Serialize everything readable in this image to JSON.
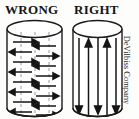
{
  "figure": {
    "title_left": "WRONG",
    "title_right": "RIGHT",
    "credit": "DeVilbiss Company",
    "colors": {
      "ink": "#151515",
      "outline": "#1a1a1a",
      "dashed_guide": "#9a9a9a",
      "background": "#fdfdfc"
    }
  },
  "panels": {
    "wrong": {
      "name": "WRONG",
      "cylinder": {
        "left": 2,
        "right": 57,
        "top_ellipse_cy": 11,
        "bottom_ellipse_cy": 90,
        "rx": 27.5,
        "ry": 8.5
      },
      "guides": [
        {
          "x": 16,
          "dashed": true
        },
        {
          "x": 30,
          "dashed": true
        },
        {
          "x": 44,
          "dashed": true
        }
      ],
      "arrows": [
        {
          "row": 1,
          "y": 24,
          "x1": 8,
          "x2": 29,
          "direction": "right"
        },
        {
          "row": 1,
          "y": 27,
          "x1": 51,
          "x2": 32,
          "direction": "left"
        },
        {
          "row": 2,
          "y": 33,
          "x1": 27,
          "x2": 6,
          "direction": "left"
        },
        {
          "row": 2,
          "y": 36,
          "x1": 31,
          "x2": 52,
          "direction": "right"
        },
        {
          "row": 3,
          "y": 42,
          "x1": 8,
          "x2": 29,
          "direction": "right"
        },
        {
          "row": 3,
          "y": 45,
          "x1": 51,
          "x2": 32,
          "direction": "left"
        },
        {
          "row": 4,
          "y": 51,
          "x1": 27,
          "x2": 6,
          "direction": "left"
        },
        {
          "row": 4,
          "y": 54,
          "x1": 31,
          "x2": 52,
          "direction": "right"
        },
        {
          "row": 5,
          "y": 60,
          "x1": 8,
          "x2": 29,
          "direction": "right"
        },
        {
          "row": 5,
          "y": 63,
          "x1": 51,
          "x2": 32,
          "direction": "left"
        },
        {
          "row": 6,
          "y": 69,
          "x1": 27,
          "x2": 6,
          "direction": "left"
        },
        {
          "row": 6,
          "y": 72,
          "x1": 31,
          "x2": 52,
          "direction": "right"
        },
        {
          "row": 7,
          "y": 78,
          "x1": 8,
          "x2": 29,
          "direction": "right"
        },
        {
          "row": 7,
          "y": 81,
          "x1": 51,
          "x2": 32,
          "direction": "left"
        },
        {
          "row": 8,
          "y": 88,
          "x1": 27,
          "x2": 6,
          "direction": "left"
        },
        {
          "row": 8,
          "y": 91,
          "x1": 31,
          "x2": 52,
          "direction": "right"
        }
      ],
      "description": "Zigzag horizontal back-and-forth spray strokes"
    },
    "right": {
      "name": "RIGHT",
      "cylinder": {
        "left": 3,
        "right": 52,
        "top_ellipse_cy": 11,
        "bottom_ellipse_cy": 90,
        "rx": 24.5,
        "ry": 8.5
      },
      "strokes": [
        {
          "x": 9,
          "y_top": 22,
          "y_bottom": 95,
          "direction": "down"
        },
        {
          "x": 19,
          "y_top": 22,
          "y_bottom": 95,
          "direction": "up"
        },
        {
          "x": 28,
          "y_top": 22,
          "y_bottom": 95,
          "direction": "down"
        },
        {
          "x": 37,
          "y_top": 22,
          "y_bottom": 95,
          "direction": "up"
        },
        {
          "x": 46,
          "y_top": 22,
          "y_bottom": 95,
          "direction": "down"
        }
      ],
      "description": "Straight parallel vertical strokes, alternating up and down"
    }
  }
}
